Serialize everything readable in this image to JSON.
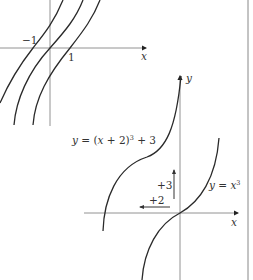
{
  "figure": {
    "frame_color": "#888888",
    "curve_color": "#2a2a2a",
    "axis_color": "#777777"
  },
  "top_graph": {
    "x_axis_label": "x",
    "tick_labels": [
      "−1",
      "1"
    ],
    "curves": [
      "y = (x+1)^3",
      "y = x^3",
      "y = (x−1)^3"
    ]
  },
  "bottom_graph": {
    "x_axis_label": "x",
    "y_axis_label": "y",
    "curve_labels": {
      "shifted": {
        "prefix": "y = (x + 2)",
        "exp": "3",
        "suffix": " + 3"
      },
      "base": {
        "prefix": "y = x",
        "exp": "3"
      }
    },
    "shift_labels": {
      "vertical": "+3",
      "horizontal": "+2"
    }
  }
}
